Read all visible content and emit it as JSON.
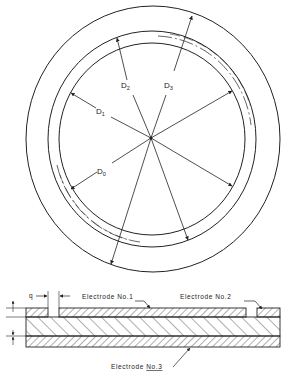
{
  "figure": {
    "plan_view": {
      "labels": {
        "d0": {
          "main": "D",
          "sub": "0"
        },
        "d1": {
          "main": "D",
          "sub": "1"
        },
        "d2": {
          "main": "D",
          "sub": "2"
        },
        "d3": {
          "main": "D",
          "sub": "3"
        }
      }
    },
    "cross_section": {
      "gap_label": "q",
      "electrode1": "Electrode No.1",
      "electrode2": "Electrode No.2",
      "electrode3_prefix": "Electrode ",
      "electrode3_num": "No.3"
    }
  }
}
